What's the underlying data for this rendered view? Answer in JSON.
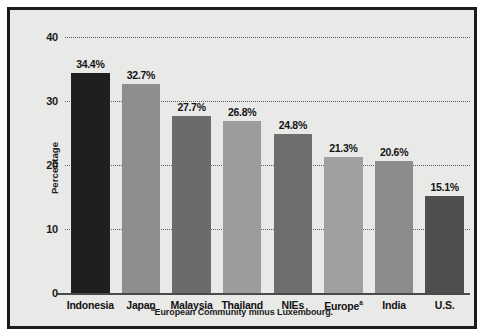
{
  "chart_data": {
    "type": "bar",
    "title": "",
    "xlabel": "",
    "ylabel": "Percentage",
    "ylim": [
      0,
      40
    ],
    "yticks": [
      0,
      10,
      20,
      30,
      40
    ],
    "ytick_labels": [
      "0",
      "10",
      "20",
      "30",
      "40"
    ],
    "grid": true,
    "grid_style": "dotted horizontal",
    "legend": "none",
    "categories": [
      "Indonesia",
      "Japan",
      "Malaysia",
      "Thailand",
      "NIEs",
      "Europe",
      "India",
      "U.S."
    ],
    "category_labels": [
      "Indonesia",
      "Japan",
      "Malaysia",
      "Thailand",
      "NIEs",
      "Europeᵃ",
      "India",
      "U.S."
    ],
    "values": [
      34.4,
      32.7,
      27.7,
      26.8,
      24.8,
      21.3,
      20.6,
      15.1
    ],
    "value_labels": [
      "34.4%",
      "32.7%",
      "27.7%",
      "26.8%",
      "24.8%",
      "21.3%",
      "20.6%",
      "15.1%"
    ],
    "bar_colors": [
      "#1f1f1f",
      "#8e8e8e",
      "#6b6b6b",
      "#9c9c9c",
      "#6e6e6e",
      "#a0a0a0",
      "#8c8c8c",
      "#4e4e4e"
    ],
    "footnote": "European Community minus Luxembourg.",
    "footnote_marker": "a"
  },
  "figure": {
    "background": "#e9e9e7",
    "border_color": "#1b1b1b",
    "grid_color": "#5f5f5f",
    "axis_color": "#4a4a4a",
    "text_color": "#141414"
  }
}
